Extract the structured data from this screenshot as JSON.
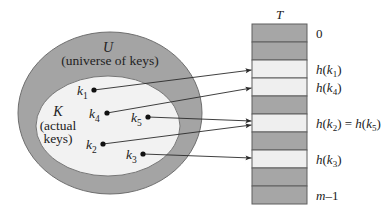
{
  "diagram": {
    "colors": {
      "outer_fill": "#a4a4a4",
      "outer_stroke": "#6e6e6e",
      "inner_fill": "#f2f2f2",
      "inner_stroke": "#777777",
      "slot_dark": "#a6a6a6",
      "slot_light": "#efefef",
      "slot_stroke": "#5e5e5e",
      "line": "#2a2a2a",
      "dot": "#111111"
    },
    "universe": {
      "symbol": "U",
      "caption": "(universe of keys)",
      "cx": 110,
      "cy": 113,
      "rx": 92,
      "ry": 81
    },
    "actual": {
      "symbol": "K",
      "caption_line1": "(actual",
      "caption_line2": "keys)",
      "cx": 108,
      "cy": 126,
      "rx": 72,
      "ry": 50
    },
    "keys": [
      {
        "name": "k",
        "sub": "1",
        "x": 94,
        "y": 90,
        "label_x": 77,
        "label_y": 95,
        "target_y": 70
      },
      {
        "name": "k",
        "sub": "4",
        "x": 107,
        "y": 113,
        "label_x": 89,
        "label_y": 118,
        "target_y": 88
      },
      {
        "name": "k",
        "sub": "5",
        "x": 148,
        "y": 117,
        "label_x": 131,
        "label_y": 122,
        "target_y": 121
      },
      {
        "name": "k",
        "sub": "2",
        "x": 103,
        "y": 144,
        "label_x": 86,
        "label_y": 149,
        "target_y": 125
      },
      {
        "name": "k",
        "sub": "3",
        "x": 143,
        "y": 154,
        "label_x": 126,
        "label_y": 159,
        "target_y": 158
      }
    ],
    "table": {
      "title": "T",
      "x": 252,
      "y": 24,
      "width": 55,
      "slot_height": 18,
      "slots": [
        {
          "shade": "dark",
          "label": "0"
        },
        {
          "shade": "dark",
          "label": ""
        },
        {
          "shade": "light",
          "label": "h(k1)"
        },
        {
          "shade": "light",
          "label": "h(k4)"
        },
        {
          "shade": "dark",
          "label": ""
        },
        {
          "shade": "light",
          "label": "h(k2) = h(k5)"
        },
        {
          "shade": "dark",
          "label": ""
        },
        {
          "shade": "light",
          "label": "h(k3)"
        },
        {
          "shade": "dark",
          "label": ""
        },
        {
          "shade": "dark",
          "label": "m–1"
        }
      ]
    }
  }
}
